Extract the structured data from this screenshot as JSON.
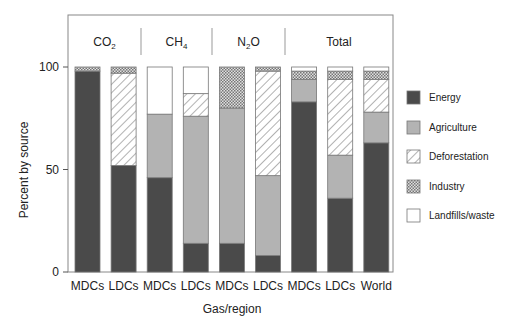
{
  "chart_data": {
    "type": "bar",
    "stacked": true,
    "title": "",
    "xlabel": "Gas/region",
    "ylabel": "Percent by source",
    "ylim": [
      0,
      100
    ],
    "yticks": [
      0,
      50,
      100
    ],
    "grid": false,
    "legend_position": "right",
    "groups": [
      {
        "label": "CO",
        "sub": "2",
        "bars": [
          0,
          1
        ]
      },
      {
        "label": "CH",
        "sub": "4",
        "bars": [
          2,
          3
        ]
      },
      {
        "label": "N",
        "sub": "2",
        "suffix": "O",
        "bars": [
          4,
          5
        ]
      },
      {
        "label": "Total",
        "sub": "",
        "bars": [
          6,
          7,
          8
        ]
      }
    ],
    "categories": [
      "MDCs",
      "LDCs",
      "MDCs",
      "LDCs",
      "MDCs",
      "LDCs",
      "MDCs",
      "LDCs",
      "World"
    ],
    "series": [
      {
        "name": "Energy",
        "fill": "#4a4a4a",
        "pattern": "solid",
        "values": [
          98,
          52,
          46,
          14,
          14,
          8,
          83,
          36,
          63
        ]
      },
      {
        "name": "Agriculture",
        "fill": "#b3b3b3",
        "pattern": "solid",
        "values": [
          0,
          0,
          31,
          62,
          66,
          39,
          11,
          21,
          15
        ]
      },
      {
        "name": "Deforestation",
        "fill": "#ffffff",
        "pattern": "hatch",
        "values": [
          0,
          45,
          0,
          11,
          0,
          51,
          0,
          37,
          16
        ]
      },
      {
        "name": "Industry",
        "fill": "#c8c8c8",
        "pattern": "crosshatch",
        "values": [
          2,
          3,
          0,
          0,
          20,
          2,
          4,
          4,
          4
        ]
      },
      {
        "name": "Landfills/waste",
        "fill": "#ffffff",
        "pattern": "solid",
        "values": [
          0,
          0,
          23,
          13,
          0,
          0,
          2,
          2,
          2
        ]
      }
    ]
  }
}
